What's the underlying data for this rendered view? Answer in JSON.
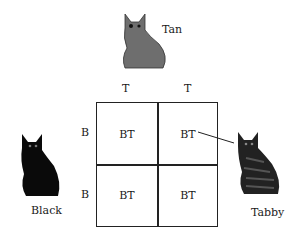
{
  "diagram": {
    "type": "punnett-square",
    "parents": {
      "top": {
        "label": "Tan",
        "color": "#707070",
        "alleles": [
          "T",
          "T"
        ]
      },
      "left": {
        "label": "Black",
        "color": "#0d0d0d",
        "alleles": [
          "B",
          "B"
        ]
      }
    },
    "offspring": {
      "label": "Tabby",
      "color": "#2a2a2a"
    },
    "cells": [
      [
        "BT",
        "BT"
      ],
      [
        "BT",
        "BT"
      ]
    ],
    "pointer_from_cell": "BT (row 1, col 2)"
  }
}
